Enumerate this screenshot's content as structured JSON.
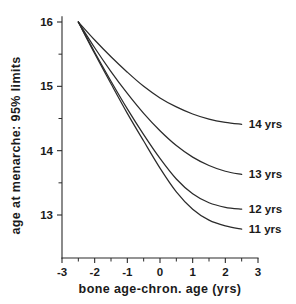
{
  "chart_data": {
    "type": "line",
    "title": "",
    "xlabel": "bone age-chron. age (yrs)",
    "ylabel": "age at menarche: 95% limits",
    "xlim": [
      -3,
      3
    ],
    "ylim": [
      12.55,
      16.25
    ],
    "grid": false,
    "legend_position": "right-inline-labels",
    "xticks": [
      -3,
      -2,
      -1,
      0,
      1,
      2,
      3
    ],
    "xticklabels": [
      "-3",
      "-2",
      "-1",
      "0",
      "1",
      "2",
      "3"
    ],
    "xminorticks": [
      -2.5,
      -1.5,
      -0.5,
      0.5,
      1.5,
      2.5
    ],
    "yticks": [
      13,
      14,
      15,
      16
    ],
    "yticklabels": [
      "13",
      "14",
      "15",
      "16"
    ],
    "yminorticks": [
      13.5,
      14.5,
      15.5
    ],
    "series": [
      {
        "name": "14 yrs",
        "label": "14 yrs",
        "x": [
          -2.5,
          -2.0,
          -1.5,
          -1.0,
          -0.5,
          0.0,
          0.5,
          1.0,
          1.5,
          2.0,
          2.5
        ],
        "values": [
          16.0,
          15.72,
          15.46,
          15.22,
          15.0,
          14.82,
          14.68,
          14.57,
          14.49,
          14.44,
          14.41
        ]
      },
      {
        "name": "13 yrs",
        "label": "13 yrs",
        "x": [
          -2.5,
          -2.0,
          -1.5,
          -1.0,
          -0.5,
          0.0,
          0.5,
          1.0,
          1.5,
          2.0,
          2.5
        ],
        "values": [
          16.0,
          15.6,
          15.23,
          14.89,
          14.58,
          14.31,
          14.08,
          13.9,
          13.77,
          13.68,
          13.63
        ]
      },
      {
        "name": "12 yrs",
        "label": "12 yrs",
        "x": [
          -2.5,
          -2.0,
          -1.5,
          -1.0,
          -0.5,
          0.0,
          0.5,
          1.0,
          1.5,
          2.0,
          2.5
        ],
        "values": [
          16.0,
          15.53,
          15.08,
          14.65,
          14.25,
          13.88,
          13.56,
          13.33,
          13.19,
          13.12,
          13.09
        ]
      },
      {
        "name": "11 yrs",
        "label": "11 yrs",
        "x": [
          -2.5,
          -2.0,
          -1.5,
          -1.0,
          -0.5,
          0.0,
          0.5,
          1.0,
          1.5,
          2.0,
          2.5
        ],
        "values": [
          16.0,
          15.51,
          15.04,
          14.58,
          14.15,
          13.73,
          13.36,
          13.09,
          12.92,
          12.83,
          12.78
        ]
      }
    ],
    "series_label_anchor_x": 2.72,
    "series_label_anchor_y": [
      14.41,
      13.63,
      13.09,
      12.78
    ],
    "line_color": "#2b2b2b",
    "background_color": "#ffffff"
  }
}
